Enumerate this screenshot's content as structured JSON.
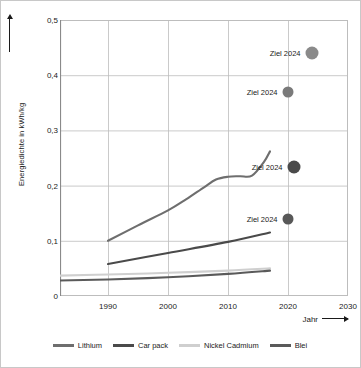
{
  "chart_data": {
    "type": "line",
    "title": "",
    "xlabel": "Jahr",
    "ylabel": "Energiedichte in kWh/kg",
    "xlim": [
      1982,
      2030
    ],
    "ylim": [
      0,
      0.5
    ],
    "grid": true,
    "legend_position": "bottom",
    "xticks": [
      "1990",
      "2000",
      "2010",
      "2020",
      "2030"
    ],
    "xtick_values": [
      1990,
      2000,
      2010,
      2020,
      2030
    ],
    "yticks": [
      "0",
      "0,1",
      "0,2",
      "0,3",
      "0,4",
      "0,5"
    ],
    "ytick_values": [
      0,
      0.1,
      0.2,
      0.3,
      0.4,
      0.5
    ],
    "series": [
      {
        "name": "Lithium",
        "color": "#6e6e6e",
        "x": [
          1990,
          1995,
          2000,
          2003,
          2006,
          2008,
          2010,
          2012,
          2014,
          2016,
          2017
        ],
        "values": [
          0.1,
          0.128,
          0.155,
          0.175,
          0.197,
          0.211,
          0.216,
          0.217,
          0.218,
          0.243,
          0.262
        ]
      },
      {
        "name": "Car pack",
        "color": "#4a4a4a",
        "x": [
          1990,
          2000,
          2010,
          2017
        ],
        "values": [
          0.058,
          0.078,
          0.098,
          0.115
        ]
      },
      {
        "name": "Nickel Cadmium",
        "color": "#cfcfcf",
        "x": [
          1982,
          1990,
          2000,
          2010,
          2017
        ],
        "values": [
          0.037,
          0.039,
          0.042,
          0.046,
          0.05
        ]
      },
      {
        "name": "Blei",
        "color": "#5a5a5a",
        "x": [
          1982,
          1990,
          2000,
          2010,
          2017
        ],
        "values": [
          0.028,
          0.03,
          0.034,
          0.04,
          0.046
        ]
      }
    ],
    "annotations": [
      {
        "label": "Ziel 2024",
        "x": 2024,
        "y": 0.44,
        "color": "#8a8a8a",
        "radius": 6.5
      },
      {
        "label": "Ziel 2024",
        "x": 2020,
        "y": 0.37,
        "color": "#7a7a7a",
        "radius": 5.5
      },
      {
        "label": "Ziel 2024",
        "x": 2021,
        "y": 0.233,
        "color": "#4a4a4a",
        "radius": 6.5
      },
      {
        "label": "Ziel 2024",
        "x": 2020,
        "y": 0.14,
        "color": "#585858",
        "radius": 5.5
      }
    ],
    "legend": [
      {
        "label": "Lithium",
        "color": "#6e6e6e"
      },
      {
        "label": "Car pack",
        "color": "#4a4a4a"
      },
      {
        "label": "Nickel Cadmium",
        "color": "#cfcfcf"
      },
      {
        "label": "Blei",
        "color": "#5a5a5a"
      }
    ],
    "colors": {
      "grid": "#bdbdbd",
      "axis": "#7a7a7a",
      "text": "#1a1a1a",
      "background": "#ffffff"
    }
  }
}
